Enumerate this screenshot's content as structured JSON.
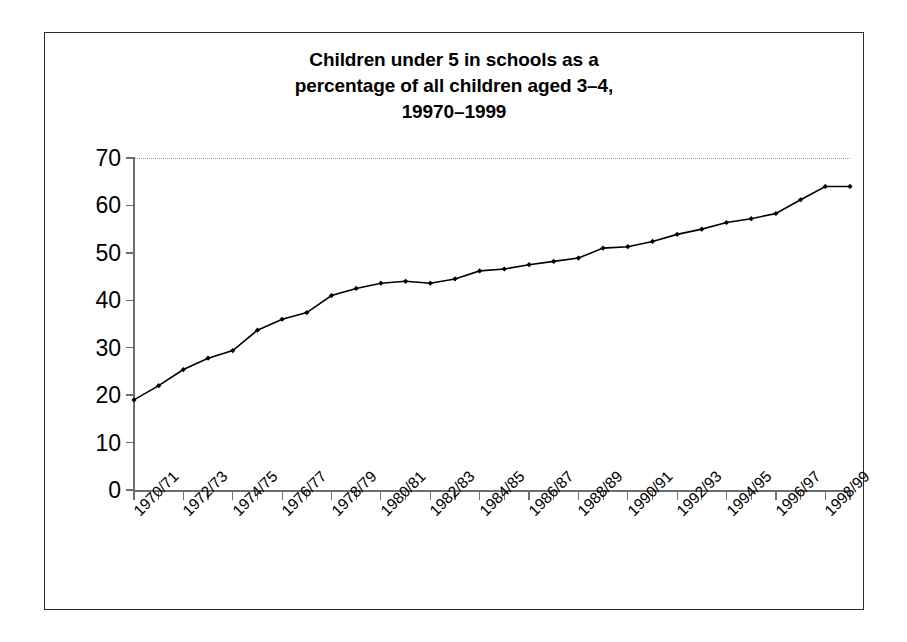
{
  "figure": {
    "title": "Children under 5 in schools as a percentage of all children aged 3–4, 19970–1999",
    "title_lines": [
      "Children under 5 in schools as a",
      "percentage of all children aged 3–4,",
      "19970–1999"
    ],
    "border_color": "#2b2b2b",
    "background": "#ffffff"
  },
  "chart_data": {
    "type": "line",
    "title": "Children under 5 in schools as a percentage of all children aged 3–4, 19970–1999",
    "xlabel": "",
    "ylabel": "",
    "ylim": [
      0,
      70
    ],
    "ytick_values": [
      0,
      10,
      20,
      30,
      40,
      50,
      60,
      70
    ],
    "ytick_labels": [
      "0",
      "10",
      "20",
      "30",
      "40",
      "50",
      "60",
      "70"
    ],
    "grid": "top-gridline-only-dotted",
    "legend": "none",
    "line_color": "#000000",
    "marker": "diamond",
    "marker_color": "#000000",
    "xtick_label_rotation": -45,
    "xtick_label_interval": 2,
    "categories": [
      "1970/71",
      "1971/72",
      "1972/73",
      "1973/74",
      "1974/75",
      "1975/76",
      "1976/77",
      "1977/78",
      "1978/79",
      "1979/80",
      "1980/81",
      "1981/82",
      "1982/83",
      "1983/84",
      "1984/85",
      "1985/86",
      "1986/87",
      "1987/88",
      "1988/89",
      "1989/90",
      "1990/91",
      "1991/92",
      "1992/93",
      "1993/94",
      "1994/95",
      "1995/96",
      "1996/97",
      "1997/98",
      "1998/99",
      "1999/00"
    ],
    "displayed_xtick_labels": [
      "1970/71",
      "1972/73",
      "1974/75",
      "1976/77",
      "1978/79",
      "1980/81",
      "1982/83",
      "1984/85",
      "1986/87",
      "1988/89",
      "1990/91",
      "1992/93",
      "1994/95",
      "1996/97",
      "1998/99"
    ],
    "values": [
      19.0,
      22.0,
      25.4,
      27.8,
      29.4,
      33.7,
      36.0,
      37.4,
      41.0,
      42.5,
      43.6,
      44.0,
      43.6,
      44.5,
      46.2,
      46.6,
      47.5,
      48.2,
      48.9,
      51.0,
      51.3,
      52.4,
      53.9,
      55.0,
      56.4,
      57.2,
      58.3,
      61.2,
      64.0,
      64.0
    ]
  }
}
